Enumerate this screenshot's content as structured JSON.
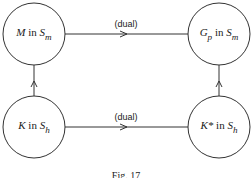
{
  "nodes": {
    "top_left": {
      "main": "M",
      "mid": " in ",
      "space": "S",
      "sub": "m"
    },
    "top_right": {
      "main": "G",
      "msub": "p",
      "mid": " in ",
      "space": "S",
      "sub": "m"
    },
    "bottom_left": {
      "main": "K",
      "mid": " in ",
      "space": "S",
      "sub": "h"
    },
    "bottom_right": {
      "main": "K*",
      "mid": " in ",
      "space": "S",
      "sub": "h"
    }
  },
  "edges": {
    "top_label": "(dual)",
    "bottom_label": "(dual)"
  },
  "caption": "Fig. 17"
}
